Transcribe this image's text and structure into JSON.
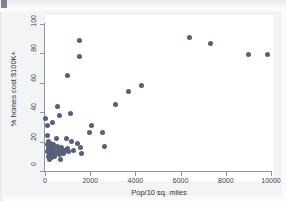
{
  "figure": {
    "background_color": "#f3f4f6",
    "plot_background_color": "#ffffff",
    "axis_color": "#8e939c",
    "marker_color": "#585f78"
  },
  "chart_data": {
    "type": "scatter",
    "title": "",
    "xlabel": "Pop/10 sq. miles",
    "ylabel": "% homes cost $100K+",
    "xlim": [
      0,
      10000
    ],
    "ylim": [
      0,
      100
    ],
    "xticks": [
      0,
      2000,
      4000,
      6000,
      8000,
      10000
    ],
    "yticks": [
      0,
      20,
      40,
      60,
      80,
      100
    ],
    "xticklabels": [
      "0",
      "2000",
      "4000",
      "6000",
      "8000",
      "10000"
    ],
    "yticklabels": [
      "0",
      "20",
      "40",
      "60",
      "80",
      "100"
    ],
    "grid": false,
    "legend": false,
    "series": [
      {
        "name": "states",
        "marker": "circle",
        "color": "#585f78",
        "points": [
          [
            40,
            36
          ],
          [
            90,
            31
          ],
          [
            110,
            24
          ],
          [
            120,
            18
          ],
          [
            130,
            13
          ],
          [
            150,
            10
          ],
          [
            160,
            20
          ],
          [
            175,
            15
          ],
          [
            185,
            12
          ],
          [
            200,
            8
          ],
          [
            215,
            17
          ],
          [
            230,
            13
          ],
          [
            250,
            11
          ],
          [
            260,
            19
          ],
          [
            275,
            14
          ],
          [
            290,
            9
          ],
          [
            300,
            16
          ],
          [
            320,
            12
          ],
          [
            345,
            33
          ],
          [
            360,
            18
          ],
          [
            380,
            13
          ],
          [
            400,
            10
          ],
          [
            430,
            15
          ],
          [
            460,
            12
          ],
          [
            500,
            22
          ],
          [
            540,
            44
          ],
          [
            560,
            17
          ],
          [
            590,
            14
          ],
          [
            620,
            11
          ],
          [
            660,
            38
          ],
          [
            700,
            8
          ],
          [
            740,
            16
          ],
          [
            790,
            13
          ],
          [
            830,
            12
          ],
          [
            880,
            14
          ],
          [
            930,
            22
          ],
          [
            980,
            65
          ],
          [
            1010,
            15
          ],
          [
            1060,
            13
          ],
          [
            1110,
            39
          ],
          [
            1180,
            20
          ],
          [
            1250,
            14
          ],
          [
            1420,
            19
          ],
          [
            1510,
            89
          ],
          [
            1540,
            78
          ],
          [
            1560,
            16
          ],
          [
            1600,
            12
          ],
          [
            1980,
            26
          ],
          [
            2060,
            31
          ],
          [
            2560,
            26
          ],
          [
            2620,
            17
          ],
          [
            3100,
            45
          ],
          [
            3690,
            54
          ],
          [
            4280,
            58
          ],
          [
            6380,
            91
          ],
          [
            7340,
            87
          ],
          [
            8990,
            79
          ],
          [
            9840,
            79
          ]
        ]
      }
    ]
  }
}
